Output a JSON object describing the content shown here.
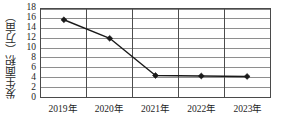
{
  "chart_data": {
    "type": "line",
    "title": "",
    "subtitle": "",
    "xlabel": "",
    "ylabel": "发生面积（万亩）",
    "categories": [
      "2019年",
      "2020年",
      "2021年",
      "2022年",
      "2023年"
    ],
    "series": [
      {
        "name": "发生面积",
        "values": [
          15.8,
          12.0,
          4.4,
          4.3,
          4.2
        ]
      }
    ],
    "ylim": [
      0,
      18
    ],
    "ytick_step": 2,
    "ytick_labels": [
      "0",
      "2",
      "4",
      "6",
      "8",
      "10",
      "12",
      "14",
      "16",
      "18"
    ],
    "xtick_labels": [
      "2019年",
      "2020年",
      "2021年",
      "2022年",
      "2023年"
    ],
    "grid": {
      "horizontal": true,
      "vertical": true,
      "horizontal_color": "#808080",
      "vertical_color": "#4a4a4a"
    },
    "legend": {
      "visible": false,
      "position": "none",
      "entries": []
    },
    "colors": {
      "line": "#1a1a1a",
      "marker": "#1a1a1a",
      "axis": "#4a4a4a",
      "grid": "#808080",
      "background": "#ffffff",
      "text": "#1e1e1e"
    },
    "marker": {
      "shape": "diamond",
      "size": 3
    }
  }
}
